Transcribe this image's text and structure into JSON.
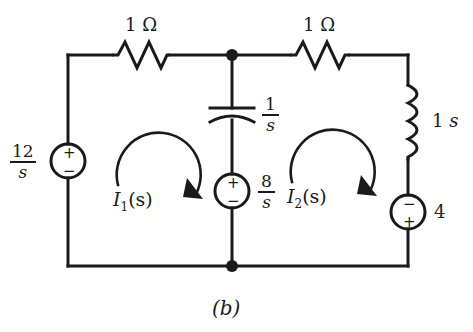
{
  "figure": {
    "caption": "(b)",
    "background_color": "#ffffff",
    "line_color": "#1a1a1a"
  },
  "components": {
    "resistor_left": {
      "name": "resistor-left",
      "label_value": "1",
      "label_unit": "Ω",
      "label": "1 Ω"
    },
    "resistor_right": {
      "name": "resistor-right",
      "label_value": "1",
      "label_unit": "Ω",
      "label": "1 Ω"
    },
    "capacitor": {
      "name": "capacitor-center",
      "numerator": "1",
      "denominator": "s",
      "label": "1/s"
    },
    "inductor": {
      "name": "inductor-right",
      "label_value": "1",
      "label_unit": "s",
      "label": "1 s"
    },
    "source_left": {
      "name": "voltage-source-left",
      "numerator": "12",
      "denominator": "s",
      "label": "12/s",
      "polarity_top": "+",
      "polarity_bottom": "−"
    },
    "source_center": {
      "name": "voltage-source-center",
      "numerator": "8",
      "denominator": "s",
      "label": "8/s",
      "polarity_top": "+",
      "polarity_bottom": "−"
    },
    "source_right": {
      "name": "voltage-source-right",
      "label": "4",
      "polarity_top": "−",
      "polarity_bottom": "+"
    }
  },
  "mesh_currents": [
    {
      "name": "mesh-current-1",
      "symbol": "I",
      "subscript": "1",
      "arg": "(s)",
      "label": "I₁(s)",
      "direction": "clockwise"
    },
    {
      "name": "mesh-current-2",
      "symbol": "I",
      "subscript": "2",
      "arg": "(s)",
      "label": "I₂(s)",
      "direction": "clockwise"
    }
  ],
  "nodes": [
    {
      "name": "node-top-center"
    },
    {
      "name": "node-bottom-center"
    }
  ]
}
